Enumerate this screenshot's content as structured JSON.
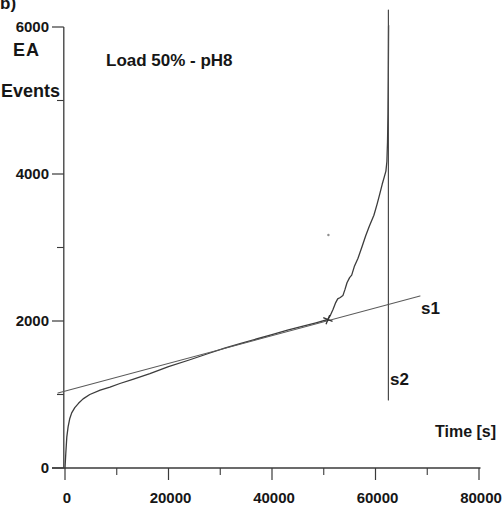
{
  "figure": {
    "background": "#ffffff",
    "ink_color": "#3a3a3a",
    "curve_color": "#3c3c3c",
    "fit_line_color": "#5a5a5a",
    "vertical_line_color": "#4a4a4a",
    "text_color": "#161616"
  },
  "chart_data": {
    "type": "line",
    "panel_label": "b)",
    "annotation": "Load 50% - pH8",
    "ylabel_line1": "EA",
    "ylabel_line2": "Events",
    "xlabel": "Time [s]",
    "xlim": [
      0,
      80000
    ],
    "ylim": [
      0,
      6000
    ],
    "x_major_ticks": [
      0,
      20000,
      40000,
      60000,
      80000
    ],
    "x_minor_ticks": [
      10000,
      30000,
      50000,
      70000
    ],
    "y_major_ticks": [
      0,
      2000,
      4000,
      6000
    ],
    "y_minor_ticks": [
      1000,
      3000,
      5000
    ],
    "grid": false,
    "legend_position": "none",
    "series": [
      {
        "name": "ea-cumulative-events-curve",
        "label": "",
        "points": [
          [
            0,
            0
          ],
          [
            150,
            200
          ],
          [
            350,
            420
          ],
          [
            600,
            560
          ],
          [
            900,
            670
          ],
          [
            1300,
            750
          ],
          [
            1900,
            820
          ],
          [
            2600,
            880
          ],
          [
            3500,
            940
          ],
          [
            4800,
            1000
          ],
          [
            6800,
            1060
          ],
          [
            8700,
            1100
          ],
          [
            10600,
            1150
          ],
          [
            13100,
            1205
          ],
          [
            16400,
            1285
          ],
          [
            20000,
            1380
          ],
          [
            24000,
            1470
          ],
          [
            28000,
            1565
          ],
          [
            31000,
            1635
          ],
          [
            34000,
            1695
          ],
          [
            37000,
            1755
          ],
          [
            40000,
            1815
          ],
          [
            43000,
            1875
          ],
          [
            46000,
            1930
          ],
          [
            48500,
            1975
          ],
          [
            50800,
            2020
          ],
          [
            51300,
            2080
          ],
          [
            51800,
            2160
          ],
          [
            52300,
            2250
          ],
          [
            52700,
            2300
          ],
          [
            53200,
            2320
          ],
          [
            53700,
            2345
          ],
          [
            54100,
            2430
          ],
          [
            54500,
            2520
          ],
          [
            55000,
            2590
          ],
          [
            55400,
            2625
          ],
          [
            55900,
            2740
          ],
          [
            56600,
            2850
          ],
          [
            57400,
            3010
          ],
          [
            58100,
            3160
          ],
          [
            58800,
            3290
          ],
          [
            59700,
            3440
          ],
          [
            60300,
            3590
          ],
          [
            60800,
            3720
          ],
          [
            61300,
            3860
          ],
          [
            61700,
            3960
          ],
          [
            62000,
            4040
          ],
          [
            62200,
            4170
          ],
          [
            62320,
            4430
          ],
          [
            62420,
            4830
          ],
          [
            62480,
            5310
          ],
          [
            62520,
            5780
          ],
          [
            62540,
            6020
          ]
        ]
      },
      {
        "name": "s1-regression-line",
        "label": "s1",
        "points": [
          [
            -1350,
            1020
          ],
          [
            68600,
            2340
          ]
        ]
      },
      {
        "name": "s2-vertical-line",
        "label": "s2",
        "points": [
          [
            62500,
            925
          ],
          [
            62500,
            6230
          ]
        ]
      }
    ],
    "breakpoint_marker": {
      "t": 50800,
      "events": 2020
    },
    "scan_speck": {
      "t": 50900,
      "events": 3170
    }
  }
}
